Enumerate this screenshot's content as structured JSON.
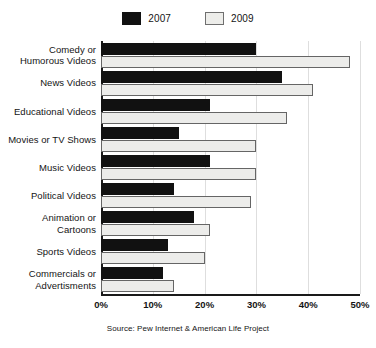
{
  "chart_data": {
    "type": "bar",
    "orientation": "horizontal",
    "title": "",
    "subtitle": "",
    "xlabel": "",
    "ylabel": "",
    "xlim": [
      0,
      50
    ],
    "xunit": "%",
    "grid": true,
    "legend_position": "top-center",
    "source_note": "Source: Pew Internet & American Life Project",
    "categories": [
      "Comedy or\nHumorous Videos",
      "News Videos",
      "Educational Videos",
      "Movies or TV Shows",
      "Music Videos",
      "Political Videos",
      "Animation or\nCartoons",
      "Sports Videos",
      "Commercials or\nAdvertisments"
    ],
    "category_lines": [
      [
        "Comedy or",
        "Humorous Videos"
      ],
      [
        "News Videos"
      ],
      [
        "Educational Videos"
      ],
      [
        "Movies or TV Shows"
      ],
      [
        "Music Videos"
      ],
      [
        "Political Videos"
      ],
      [
        "Animation or",
        "Cartoons"
      ],
      [
        "Sports Videos"
      ],
      [
        "Commercials or",
        "Advertisments"
      ]
    ],
    "series": [
      {
        "name": "2007",
        "color": "#111111",
        "values": [
          30,
          35,
          21,
          15,
          21,
          14,
          18,
          13,
          12
        ]
      },
      {
        "name": "2009",
        "color": "#ececea",
        "values": [
          48,
          41,
          36,
          30,
          30,
          29,
          21,
          20,
          14
        ]
      }
    ],
    "xticks": [
      0,
      10,
      20,
      30,
      40,
      50
    ],
    "xticklabels": [
      "0%",
      "10%",
      "20%",
      "30%",
      "40%",
      "50%"
    ]
  },
  "legend": {
    "entries": [
      {
        "label": "2007",
        "swatch": "legend-swatch-2007"
      },
      {
        "label": "2009",
        "swatch": "legend-swatch-2009"
      }
    ]
  },
  "colors": {
    "series_2007": "#111111",
    "series_2009": "#ececea",
    "series_2009_border": "#656565",
    "axis": "#1a1a1a",
    "grid": "#dedede",
    "text": "#141414",
    "background": "#ffffff"
  }
}
